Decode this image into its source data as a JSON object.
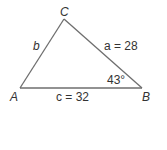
{
  "diagram": {
    "type": "triangle",
    "vertices": {
      "A": {
        "label": "A",
        "x": 20,
        "y": 88
      },
      "B": {
        "label": "B",
        "x": 142,
        "y": 88
      },
      "C": {
        "label": "C",
        "x": 64,
        "y": 19
      }
    },
    "sides": {
      "a": {
        "label": "a = 28",
        "var": "a",
        "value": 28,
        "between": [
          "B",
          "C"
        ]
      },
      "b": {
        "label": "b",
        "var": "b",
        "value": null,
        "between": [
          "A",
          "C"
        ]
      },
      "c": {
        "label": "c = 32",
        "var": "c",
        "value": 32,
        "between": [
          "A",
          "B"
        ]
      }
    },
    "angles": {
      "B": {
        "label": "43°",
        "value": 43,
        "unit": "degrees"
      }
    },
    "colors": {
      "stroke": "#6e6e6e",
      "text": "#333333",
      "background": "#ffffff"
    }
  }
}
